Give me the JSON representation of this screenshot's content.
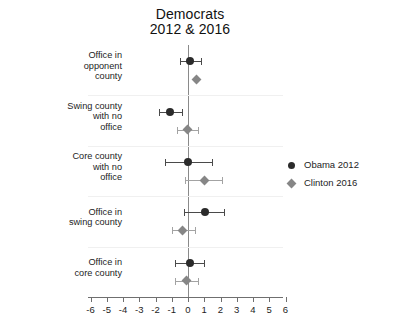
{
  "chart_data": {
    "type": "scatter",
    "title": "Democrats",
    "subtitle": "2012 & 2016",
    "xlabel": "",
    "ylabel": "",
    "xlim": [
      -6.5,
      6.5
    ],
    "xticks": [
      -6,
      -5,
      -4,
      -3,
      -2,
      -1,
      0,
      1,
      2,
      3,
      4,
      5,
      6
    ],
    "xticklabels": [
      "-6",
      "-5",
      "-4",
      "-3",
      "-2",
      "-1",
      "0",
      "1",
      "2",
      "3",
      "4",
      "5",
      "6"
    ],
    "grid": false,
    "zero_reference_line": 0,
    "legend_position": "right",
    "categories": [
      "Office in opponent county",
      "Swing county with no office",
      "Core county with no office",
      "Office in swing county",
      "Office in core county"
    ],
    "category_lines": [
      [
        "Office in",
        "opponent",
        "county"
      ],
      [
        "Swing county",
        "with no",
        "office"
      ],
      [
        "Core county",
        "with no",
        "office"
      ],
      [
        "Office in",
        "swing county"
      ],
      [
        "Office in",
        "core county"
      ]
    ],
    "series": [
      {
        "name": "Obama 2012",
        "marker": "circle",
        "color": "#2b2b2b",
        "values": [
          0.15,
          -1.1,
          0.0,
          1.05,
          0.1
        ],
        "ci_low": [
          -0.5,
          -1.8,
          -1.4,
          -0.25,
          -0.8
        ],
        "ci_high": [
          0.8,
          -0.35,
          1.5,
          2.2,
          1.0
        ]
      },
      {
        "name": "Clinton 2016",
        "marker": "diamond",
        "color": "#868686",
        "values": [
          0.55,
          -0.05,
          1.0,
          -0.35,
          -0.1
        ],
        "ci_low": [
          0.55,
          -0.7,
          -0.2,
          -1.0,
          -0.8
        ],
        "ci_high": [
          0.55,
          0.6,
          2.1,
          0.4,
          0.6
        ]
      }
    ],
    "legend": [
      {
        "label": "Obama 2012",
        "marker": "circle",
        "color": "#2b2b2b"
      },
      {
        "label": "Clinton 2016",
        "marker": "diamond",
        "color": "#868686"
      }
    ]
  }
}
